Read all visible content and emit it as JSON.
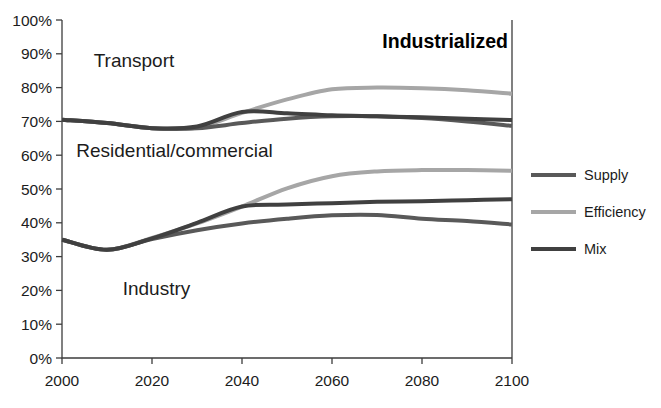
{
  "chart_data": {
    "type": "line",
    "title": "Industrialized",
    "xlabel": "",
    "ylabel": "",
    "x": [
      2000,
      2010,
      2020,
      2030,
      2040,
      2050,
      2060,
      2070,
      2080,
      2090,
      2100
    ],
    "xlim": [
      2000,
      2100
    ],
    "ylim": [
      0,
      100
    ],
    "y_tick_labels": [
      "0%",
      "10%",
      "20%",
      "30%",
      "40%",
      "50%",
      "60%",
      "70%",
      "80%",
      "90%",
      "100%"
    ],
    "y_ticks": [
      0,
      10,
      20,
      30,
      40,
      50,
      60,
      70,
      80,
      90,
      100
    ],
    "x_tick_labels": [
      "2000",
      "2020",
      "2040",
      "2060",
      "2080",
      "2100"
    ],
    "x_ticks": [
      2000,
      2020,
      2040,
      2060,
      2080,
      2100
    ],
    "grid": false,
    "legend_position": "right",
    "units": "percent",
    "band_labels": [
      {
        "text": "Transport",
        "x": 2016,
        "y": 86
      },
      {
        "text": "Residential/commercial",
        "x": 2025,
        "y": 59.5
      },
      {
        "text": "Industry",
        "x": 2021,
        "y": 18.5
      }
    ],
    "series": [
      {
        "name": "Supply",
        "color": "#595959",
        "group": "upper",
        "values": [
          70.5,
          69.5,
          68.0,
          68.0,
          69.5,
          70.8,
          71.5,
          71.5,
          71.0,
          70.0,
          68.7
        ]
      },
      {
        "name": "Efficiency",
        "color": "#a6a6a6",
        "group": "upper",
        "values": [
          70.5,
          69.5,
          68.0,
          68.2,
          72.5,
          76.5,
          79.5,
          80.0,
          79.8,
          79.2,
          78.2
        ]
      },
      {
        "name": "Mix",
        "color": "#404040",
        "group": "upper",
        "values": [
          70.5,
          69.5,
          68.0,
          68.5,
          72.8,
          72.4,
          71.8,
          71.5,
          71.2,
          70.8,
          70.4
        ]
      },
      {
        "name": "Supply",
        "color": "#595959",
        "group": "lower",
        "values": [
          35.0,
          32.0,
          35.2,
          37.8,
          39.8,
          41.2,
          42.2,
          42.3,
          41.2,
          40.5,
          39.5
        ]
      },
      {
        "name": "Efficiency",
        "color": "#a6a6a6",
        "group": "lower",
        "values": [
          35.0,
          32.0,
          35.5,
          39.8,
          44.8,
          50.2,
          53.8,
          55.2,
          55.6,
          55.6,
          55.4
        ]
      },
      {
        "name": "Mix",
        "color": "#404040",
        "group": "lower",
        "values": [
          35.0,
          32.0,
          35.4,
          40.0,
          44.8,
          45.4,
          45.8,
          46.2,
          46.4,
          46.7,
          47.0
        ]
      }
    ],
    "legend": [
      {
        "label": "Supply",
        "color": "#595959"
      },
      {
        "label": "Efficiency",
        "color": "#a6a6a6"
      },
      {
        "label": "Mix",
        "color": "#404040"
      }
    ]
  }
}
